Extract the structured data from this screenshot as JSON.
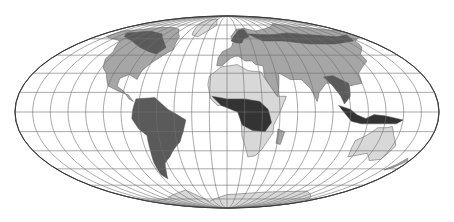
{
  "map": {
    "projection": "Mollweide",
    "width": 454,
    "height": 222,
    "center": [
      227,
      112
    ],
    "radius_x": 212,
    "radius_y": 96,
    "graticule_step_deg": 15,
    "colors": {
      "background": "#ffffff",
      "graticule": "#6e6e6e",
      "outline": "#333333",
      "land_light": "#d8d8d8",
      "land_mid": "#a6a6a6",
      "land_dark": "#5a5a5a",
      "land_darkest": "#333333"
    },
    "regions": [
      {
        "name": "north-america",
        "shade": "land_mid",
        "points": [
          [
            -165,
            68
          ],
          [
            -140,
            70
          ],
          [
            -120,
            72
          ],
          [
            -95,
            72
          ],
          [
            -80,
            70
          ],
          [
            -65,
            62
          ],
          [
            -60,
            50
          ],
          [
            -67,
            45
          ],
          [
            -75,
            38
          ],
          [
            -80,
            32
          ],
          [
            -81,
            25
          ],
          [
            -90,
            29
          ],
          [
            -97,
            26
          ],
          [
            -97,
            20
          ],
          [
            -90,
            16
          ],
          [
            -84,
            10
          ],
          [
            -80,
            8
          ],
          [
            -85,
            13
          ],
          [
            -92,
            15
          ],
          [
            -105,
            20
          ],
          [
            -112,
            30
          ],
          [
            -118,
            34
          ],
          [
            -124,
            42
          ],
          [
            -124,
            48
          ],
          [
            -135,
            58
          ],
          [
            -150,
            60
          ],
          [
            -165,
            62
          ]
        ]
      },
      {
        "name": "north-america-boreal",
        "shade": "land_dark",
        "points": [
          [
            -150,
            66
          ],
          [
            -120,
            68
          ],
          [
            -95,
            65
          ],
          [
            -80,
            58
          ],
          [
            -70,
            52
          ],
          [
            -75,
            46
          ],
          [
            -85,
            48
          ],
          [
            -100,
            52
          ],
          [
            -120,
            58
          ],
          [
            -140,
            62
          ]
        ]
      },
      {
        "name": "greenland",
        "shade": "land_light",
        "points": [
          [
            -55,
            82
          ],
          [
            -30,
            83
          ],
          [
            -20,
            75
          ],
          [
            -40,
            62
          ],
          [
            -50,
            64
          ],
          [
            -58,
            76
          ]
        ]
      },
      {
        "name": "south-america",
        "shade": "land_dark",
        "points": [
          [
            -78,
            10
          ],
          [
            -62,
            11
          ],
          [
            -50,
            2
          ],
          [
            -35,
            -6
          ],
          [
            -38,
            -15
          ],
          [
            -42,
            -23
          ],
          [
            -48,
            -28
          ],
          [
            -55,
            -35
          ],
          [
            -62,
            -40
          ],
          [
            -66,
            -48
          ],
          [
            -70,
            -54
          ],
          [
            -74,
            -50
          ],
          [
            -73,
            -40
          ],
          [
            -71,
            -30
          ],
          [
            -70,
            -18
          ],
          [
            -76,
            -13
          ],
          [
            -81,
            -5
          ],
          [
            -80,
            2
          ]
        ]
      },
      {
        "name": "europe-asia",
        "shade": "land_mid",
        "points": [
          [
            -10,
            36
          ],
          [
            -9,
            43
          ],
          [
            -5,
            48
          ],
          [
            5,
            52
          ],
          [
            8,
            58
          ],
          [
            5,
            62
          ],
          [
            15,
            70
          ],
          [
            30,
            71
          ],
          [
            45,
            68
          ],
          [
            60,
            70
          ],
          [
            80,
            73
          ],
          [
            100,
            77
          ],
          [
            120,
            73
          ],
          [
            140,
            72
          ],
          [
            160,
            70
          ],
          [
            180,
            68
          ],
          [
            180,
            62
          ],
          [
            162,
            58
          ],
          [
            155,
            52
          ],
          [
            142,
            46
          ],
          [
            140,
            40
          ],
          [
            130,
            35
          ],
          [
            122,
            30
          ],
          [
            120,
            22
          ],
          [
            108,
            20
          ],
          [
            105,
            10
          ],
          [
            100,
            14
          ],
          [
            98,
            18
          ],
          [
            92,
            22
          ],
          [
            88,
            22
          ],
          [
            80,
            15
          ],
          [
            77,
            8
          ],
          [
            73,
            18
          ],
          [
            67,
            25
          ],
          [
            57,
            25
          ],
          [
            52,
            28
          ],
          [
            48,
            30
          ],
          [
            44,
            12
          ],
          [
            38,
            18
          ],
          [
            34,
            28
          ],
          [
            35,
            36
          ],
          [
            28,
            37
          ],
          [
            25,
            40
          ],
          [
            18,
            40
          ],
          [
            12,
            44
          ],
          [
            8,
            44
          ],
          [
            3,
            42
          ],
          [
            -5,
            36
          ]
        ]
      },
      {
        "name": "siberia-boreal",
        "shade": "land_dark",
        "points": [
          [
            30,
            65
          ],
          [
            60,
            64
          ],
          [
            90,
            66
          ],
          [
            120,
            64
          ],
          [
            150,
            62
          ],
          [
            170,
            64
          ],
          [
            160,
            58
          ],
          [
            130,
            55
          ],
          [
            100,
            55
          ],
          [
            70,
            58
          ],
          [
            45,
            58
          ]
        ]
      },
      {
        "name": "scandinavia",
        "shade": "land_dark",
        "points": [
          [
            5,
            58
          ],
          [
            10,
            63
          ],
          [
            18,
            69
          ],
          [
            28,
            70
          ],
          [
            30,
            62
          ],
          [
            22,
            60
          ],
          [
            18,
            56
          ],
          [
            12,
            56
          ]
        ]
      },
      {
        "name": "africa",
        "shade": "land_light",
        "points": [
          [
            -17,
            21
          ],
          [
            -16,
            28
          ],
          [
            -10,
            32
          ],
          [
            -6,
            35
          ],
          [
            10,
            37
          ],
          [
            20,
            32
          ],
          [
            32,
            31
          ],
          [
            33,
            28
          ],
          [
            43,
            12
          ],
          [
            51,
            12
          ],
          [
            45,
            0
          ],
          [
            40,
            -10
          ],
          [
            40,
            -16
          ],
          [
            35,
            -24
          ],
          [
            32,
            -29
          ],
          [
            27,
            -34
          ],
          [
            20,
            -35
          ],
          [
            17,
            -28
          ],
          [
            13,
            -18
          ],
          [
            12,
            -6
          ],
          [
            9,
            4
          ],
          [
            5,
            5
          ],
          [
            -8,
            5
          ],
          [
            -14,
            10
          ]
        ]
      },
      {
        "name": "africa-tropical",
        "shade": "land_darkest",
        "points": [
          [
            -13,
            12
          ],
          [
            0,
            10
          ],
          [
            15,
            10
          ],
          [
            28,
            8
          ],
          [
            35,
            2
          ],
          [
            38,
            -8
          ],
          [
            33,
            -15
          ],
          [
            22,
            -14
          ],
          [
            13,
            -10
          ],
          [
            9,
            0
          ],
          [
            -5,
            5
          ]
        ]
      },
      {
        "name": "madagascar",
        "shade": "land_mid",
        "points": [
          [
            44,
            -13
          ],
          [
            50,
            -15
          ],
          [
            48,
            -25
          ],
          [
            44,
            -24
          ]
        ]
      },
      {
        "name": "india-se-asia",
        "shade": "land_dark",
        "points": [
          [
            88,
            27
          ],
          [
            97,
            28
          ],
          [
            108,
            22
          ],
          [
            106,
            12
          ],
          [
            100,
            6
          ],
          [
            98,
            12
          ],
          [
            92,
            22
          ]
        ]
      },
      {
        "name": "indonesia",
        "shade": "land_darkest",
        "points": [
          [
            95,
            5
          ],
          [
            105,
            2
          ],
          [
            110,
            -2
          ],
          [
            118,
            -5
          ],
          [
            125,
            -2
          ],
          [
            135,
            -3
          ],
          [
            150,
            -6
          ],
          [
            145,
            -9
          ],
          [
            130,
            -9
          ],
          [
            115,
            -9
          ],
          [
            106,
            -7
          ],
          [
            100,
            -1
          ]
        ]
      },
      {
        "name": "australia",
        "shade": "land_light",
        "points": [
          [
            114,
            -22
          ],
          [
            122,
            -18
          ],
          [
            130,
            -12
          ],
          [
            137,
            -12
          ],
          [
            142,
            -11
          ],
          [
            146,
            -18
          ],
          [
            153,
            -26
          ],
          [
            150,
            -37
          ],
          [
            140,
            -38
          ],
          [
            132,
            -32
          ],
          [
            116,
            -35
          ],
          [
            114,
            -28
          ]
        ]
      },
      {
        "name": "new-zealand",
        "shade": "land_mid",
        "points": [
          [
            167,
            -46
          ],
          [
            172,
            -41
          ],
          [
            175,
            -36
          ],
          [
            178,
            -38
          ],
          [
            173,
            -44
          ]
        ]
      },
      {
        "name": "antarctica",
        "shade": "land_light",
        "points": [
          [
            -180,
            -78
          ],
          [
            -120,
            -75
          ],
          [
            -60,
            -65
          ],
          [
            -40,
            -78
          ],
          [
            0,
            -70
          ],
          [
            60,
            -67
          ],
          [
            120,
            -66
          ],
          [
            180,
            -78
          ],
          [
            180,
            -90
          ],
          [
            -180,
            -90
          ]
        ]
      }
    ]
  }
}
